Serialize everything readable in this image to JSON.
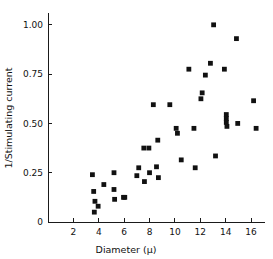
{
  "chart_data": {
    "type": "scatter",
    "title": "",
    "xlabel": "Diameter (μ)",
    "ylabel": "1/Stimulating current",
    "xlim": [
      0,
      17.1
    ],
    "ylim": [
      0,
      1.06
    ],
    "grid": false,
    "legend": null,
    "xticks": [
      2,
      4,
      6,
      8,
      10,
      12,
      14,
      16
    ],
    "xticklabels": [
      "2",
      "4",
      "6",
      "8",
      "10",
      "12",
      "14",
      "16"
    ],
    "yticks": [
      0,
      0.25,
      0.5,
      0.75,
      1.0
    ],
    "yticklabels": [
      "0",
      "0.25",
      "0.50",
      "0.75",
      "1.00"
    ],
    "marker": "square-dot",
    "marker_color": "#111111",
    "marker_size": 2.4,
    "points": [
      {
        "x": 3.5,
        "y": 0.24
      },
      {
        "x": 3.6,
        "y": 0.155
      },
      {
        "x": 3.7,
        "y": 0.105
      },
      {
        "x": 3.65,
        "y": 0.05
      },
      {
        "x": 3.95,
        "y": 0.08
      },
      {
        "x": 4.4,
        "y": 0.19
      },
      {
        "x": 5.2,
        "y": 0.25
      },
      {
        "x": 5.2,
        "y": 0.165
      },
      {
        "x": 5.25,
        "y": 0.115
      },
      {
        "x": 5.95,
        "y": 0.125
      },
      {
        "x": 6.05,
        "y": 0.125
      },
      {
        "x": 7.0,
        "y": 0.235
      },
      {
        "x": 7.15,
        "y": 0.275
      },
      {
        "x": 7.55,
        "y": 0.375
      },
      {
        "x": 7.6,
        "y": 0.205
      },
      {
        "x": 7.95,
        "y": 0.375
      },
      {
        "x": 8.0,
        "y": 0.25
      },
      {
        "x": 8.3,
        "y": 0.595
      },
      {
        "x": 8.55,
        "y": 0.28
      },
      {
        "x": 8.65,
        "y": 0.415
      },
      {
        "x": 8.7,
        "y": 0.225
      },
      {
        "x": 9.6,
        "y": 0.595
      },
      {
        "x": 10.1,
        "y": 0.475
      },
      {
        "x": 10.2,
        "y": 0.45
      },
      {
        "x": 10.5,
        "y": 0.315
      },
      {
        "x": 11.1,
        "y": 0.775
      },
      {
        "x": 11.5,
        "y": 0.475
      },
      {
        "x": 11.6,
        "y": 0.275
      },
      {
        "x": 12.05,
        "y": 0.625
      },
      {
        "x": 12.15,
        "y": 0.655
      },
      {
        "x": 12.4,
        "y": 0.745
      },
      {
        "x": 12.8,
        "y": 0.805
      },
      {
        "x": 13.05,
        "y": 1.0
      },
      {
        "x": 13.2,
        "y": 0.335
      },
      {
        "x": 13.9,
        "y": 0.775
      },
      {
        "x": 14.05,
        "y": 0.545
      },
      {
        "x": 14.05,
        "y": 0.525
      },
      {
        "x": 14.05,
        "y": 0.505
      },
      {
        "x": 14.1,
        "y": 0.485
      },
      {
        "x": 14.85,
        "y": 0.93
      },
      {
        "x": 14.95,
        "y": 0.5
      },
      {
        "x": 16.2,
        "y": 0.615
      },
      {
        "x": 16.4,
        "y": 0.475
      }
    ]
  }
}
